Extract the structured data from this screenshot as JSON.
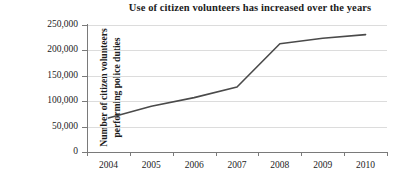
{
  "chart_data": {
    "type": "line",
    "title": "Use of citizen volunteers has increased over the years",
    "xlabel": "",
    "ylabel": "Number of citizen volunteers performing police duties",
    "ylabel_lines": [
      "Number of citizen volunteers",
      "performing police duties"
    ],
    "categories": [
      "2004",
      "2005",
      "2006",
      "2007",
      "2008",
      "2009",
      "2010"
    ],
    "values": [
      67000,
      90000,
      107000,
      128000,
      213000,
      224000,
      231000
    ],
    "ylim": [
      0,
      250000
    ],
    "yticks": [
      0,
      50000,
      100000,
      150000,
      200000,
      250000
    ],
    "ytick_labels": [
      "0",
      "50,000",
      "100,000",
      "150,000",
      "200,000",
      "250,000"
    ],
    "grid": true,
    "legend": false,
    "series": [
      {
        "name": "Citizen volunteers performing police duties",
        "values": [
          67000,
          90000,
          107000,
          128000,
          213000,
          224000,
          231000
        ],
        "color": "#4a4a4a"
      }
    ],
    "colors": {
      "line": "#4a4a4a",
      "gridline": "#dcdcdc",
      "axis": "#7a7a7a",
      "text": "#1c1c1c",
      "background": "#ffffff"
    }
  }
}
